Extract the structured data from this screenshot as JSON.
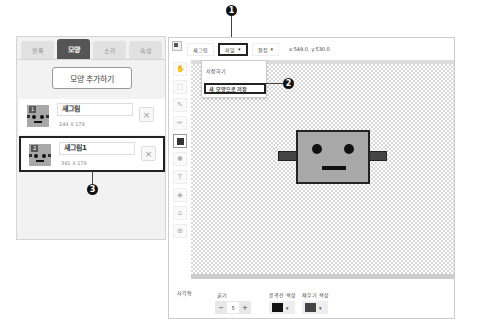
{
  "left_panel": {
    "tabs": [
      {
        "label": "블록",
        "active": false
      },
      {
        "label": "모양",
        "active": true
      },
      {
        "label": "소리",
        "active": false
      },
      {
        "label": "속성",
        "active": false
      }
    ],
    "add_shape_button": "모양 추가하기",
    "shapes": [
      {
        "index": "1",
        "name": "새그림",
        "size": "244 X 179",
        "selected": false
      },
      {
        "index": "2",
        "name": "새그림1",
        "size": "341 X 179",
        "selected": true
      }
    ],
    "delete_icon": "×"
  },
  "editor": {
    "toolbar": {
      "new_label": "새그림",
      "file_label": "파일",
      "edit_label": "편집",
      "dropdown_caret": "▾",
      "coords": "x:549.0, y:530.0"
    },
    "file_menu": {
      "items": [
        "저장하기",
        "새 모양으로 저장"
      ]
    },
    "tools": [
      {
        "name": "hand",
        "glyph": "✋"
      },
      {
        "name": "select",
        "glyph": "⬚"
      },
      {
        "name": "pen",
        "glyph": "✎"
      },
      {
        "name": "brush",
        "glyph": "✏"
      },
      {
        "name": "rectangle",
        "glyph": "■"
      },
      {
        "name": "circle",
        "glyph": "✺"
      },
      {
        "name": "text",
        "glyph": "T"
      },
      {
        "name": "fill",
        "glyph": "⛾"
      },
      {
        "name": "eraser",
        "glyph": "⌫"
      },
      {
        "name": "zoom",
        "glyph": "⊕"
      }
    ],
    "properties": {
      "shape_label": "사각형",
      "thickness_label": "굵기",
      "thickness_value": "5",
      "minus": "−",
      "plus": "+",
      "outline_color_label": "윤곽선 색상",
      "outline_color": "#111111",
      "fill_color_label": "채우기 색상",
      "fill_color": "#444444"
    }
  },
  "callouts": [
    "1",
    "2",
    "3"
  ]
}
